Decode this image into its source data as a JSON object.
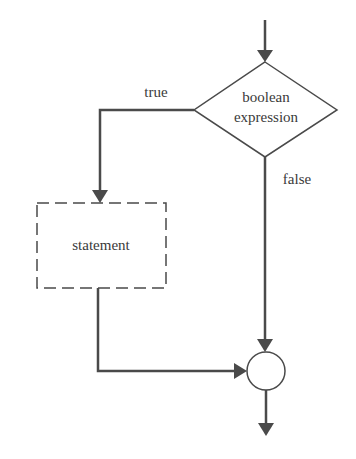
{
  "diagram": {
    "type": "flowchart",
    "title": "",
    "colors": {
      "line": "#4a4a4a",
      "text": "#3a3a3a",
      "background": "#ffffff"
    },
    "nodes": {
      "decision": {
        "line1": "boolean",
        "line2": "expression",
        "shape": "diamond"
      },
      "statement": {
        "label": "statement",
        "shape": "dashed-rectangle"
      },
      "merge": {
        "label": "",
        "shape": "circle"
      }
    },
    "edges": {
      "entry": {
        "label": ""
      },
      "true_branch": {
        "label": "true"
      },
      "false_branch": {
        "label": "false"
      },
      "statement_to_merge": {
        "label": ""
      },
      "exit": {
        "label": ""
      }
    }
  }
}
